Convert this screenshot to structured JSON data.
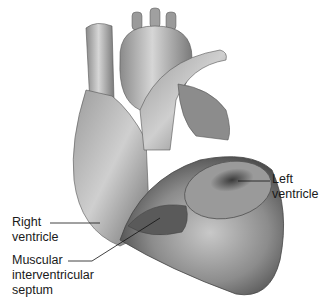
{
  "figure": {
    "labels": {
      "left_ventricle": {
        "line1": "Left",
        "line2": "ventricle"
      },
      "right_ventricle": {
        "line1": "Right",
        "line2": "ventricle"
      },
      "septum": {
        "line1": "Muscular",
        "line2": "interventricular",
        "line3": "septum"
      }
    }
  }
}
